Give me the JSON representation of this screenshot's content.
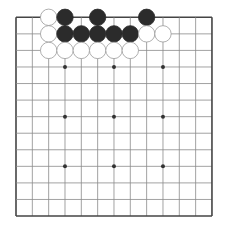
{
  "board": {
    "size": 13,
    "origin_x": 16,
    "origin_y": 17.3,
    "spacing_x": 16.33,
    "spacing_y": 16.56,
    "line_color": "#8a8a8a",
    "edge_color": "#444444",
    "hoshi": [
      [
        3,
        3
      ],
      [
        3,
        6
      ],
      [
        3,
        9
      ],
      [
        6,
        3
      ],
      [
        6,
        6
      ],
      [
        6,
        9
      ],
      [
        9,
        3
      ],
      [
        9,
        6
      ],
      [
        9,
        9
      ]
    ],
    "stone_colors": {
      "black": "#2b2b2b",
      "white": "#ffffff",
      "white_outline": "#9a9a9a"
    },
    "stones": [
      {
        "row": 0,
        "col": 2,
        "color": "white"
      },
      {
        "row": 0,
        "col": 3,
        "color": "black"
      },
      {
        "row": 0,
        "col": 5,
        "color": "black"
      },
      {
        "row": 0,
        "col": 8,
        "color": "black"
      },
      {
        "row": 1,
        "col": 2,
        "color": "white"
      },
      {
        "row": 1,
        "col": 3,
        "color": "black"
      },
      {
        "row": 1,
        "col": 4,
        "color": "black"
      },
      {
        "row": 1,
        "col": 5,
        "color": "black"
      },
      {
        "row": 1,
        "col": 6,
        "color": "black"
      },
      {
        "row": 1,
        "col": 7,
        "color": "black"
      },
      {
        "row": 1,
        "col": 8,
        "color": "white"
      },
      {
        "row": 1,
        "col": 9,
        "color": "white"
      },
      {
        "row": 2,
        "col": 2,
        "color": "white"
      },
      {
        "row": 2,
        "col": 3,
        "color": "white"
      },
      {
        "row": 2,
        "col": 4,
        "color": "white"
      },
      {
        "row": 2,
        "col": 5,
        "color": "white"
      },
      {
        "row": 2,
        "col": 6,
        "color": "white"
      },
      {
        "row": 2,
        "col": 7,
        "color": "white"
      }
    ]
  }
}
